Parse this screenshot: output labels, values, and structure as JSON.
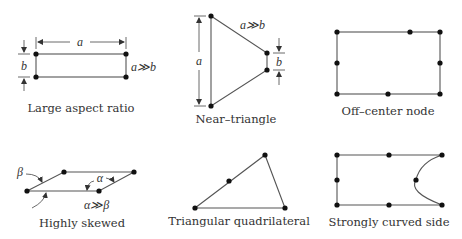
{
  "diagram": {
    "panels": [
      {
        "id": "large-aspect-ratio",
        "caption": "Large aspect ratio",
        "dim_a": "a",
        "dim_b": "b",
        "condition": "a≫b"
      },
      {
        "id": "near-triangle",
        "caption": "Near–triangle",
        "dim_a": "a",
        "dim_b": "b",
        "condition": "a≫b"
      },
      {
        "id": "off-center-node",
        "caption": "Off–center node"
      },
      {
        "id": "highly-skewed",
        "caption": "Highly skewed",
        "angle_alpha": "α",
        "angle_beta": "β",
        "condition": "α≫β"
      },
      {
        "id": "triangular-quadrilateral",
        "caption": "Triangular quadrilateral"
      },
      {
        "id": "strongly-curved-side",
        "caption": "Strongly curved side"
      }
    ]
  }
}
